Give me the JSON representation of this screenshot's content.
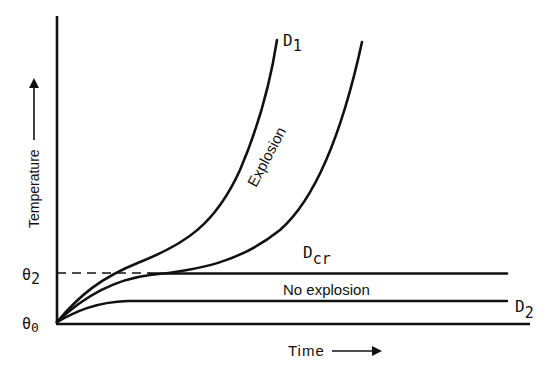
{
  "diagram": {
    "type": "thermal-explosion-temperature-time",
    "axes": {
      "y_label": "Temperature",
      "x_label": "Time",
      "y_ticks": [
        {
          "symbol": "θ",
          "subscript": "0"
        },
        {
          "symbol": "θ",
          "subscript": "2"
        }
      ]
    },
    "curves": [
      {
        "id": "D1",
        "label_main": "D",
        "label_sub": "1",
        "behavior": "explosive growth"
      },
      {
        "id": "Dcr",
        "label_main": "D",
        "label_sub": "cr",
        "behavior": "critical - branches to explosion or plateau at θ2"
      },
      {
        "id": "D2",
        "label_main": "D",
        "label_sub": "2",
        "behavior": "stable plateau"
      }
    ],
    "regions": {
      "explosion": "Explosion",
      "no_explosion": "No explosion"
    }
  }
}
